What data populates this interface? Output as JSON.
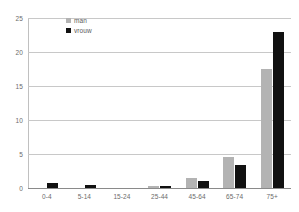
{
  "chart_data": {
    "type": "bar",
    "title": "",
    "xlabel": "",
    "ylabel": "",
    "categories": [
      "0-4",
      "5-14",
      "15-24",
      "25-44",
      "45-64",
      "65-74",
      "75+"
    ],
    "series": [
      {
        "name": "man",
        "color": "#b3b3b3",
        "values": [
          0,
          0,
          0,
          0.3,
          1.5,
          4.6,
          17.5
        ]
      },
      {
        "name": "vrouw",
        "color": "#111111",
        "values": [
          0.8,
          0.5,
          0,
          0.3,
          1.0,
          3.4,
          23.0
        ]
      }
    ],
    "ylim": [
      0,
      25
    ],
    "yticks": [
      0,
      5,
      10,
      15,
      20,
      25
    ],
    "ytick_labels": [
      "0",
      "5",
      "10",
      "15",
      "20",
      "25"
    ],
    "grid": true,
    "legend_position": "top-left-inside"
  },
  "legend": {
    "items": [
      {
        "label": "man"
      },
      {
        "label": "vrouw"
      }
    ]
  },
  "colors": {
    "male": "#b3b3b3",
    "female": "#111111",
    "gridline": "#c8c8c8",
    "axis": "#8a8a8a",
    "tick_text": "#6b6b6b"
  }
}
